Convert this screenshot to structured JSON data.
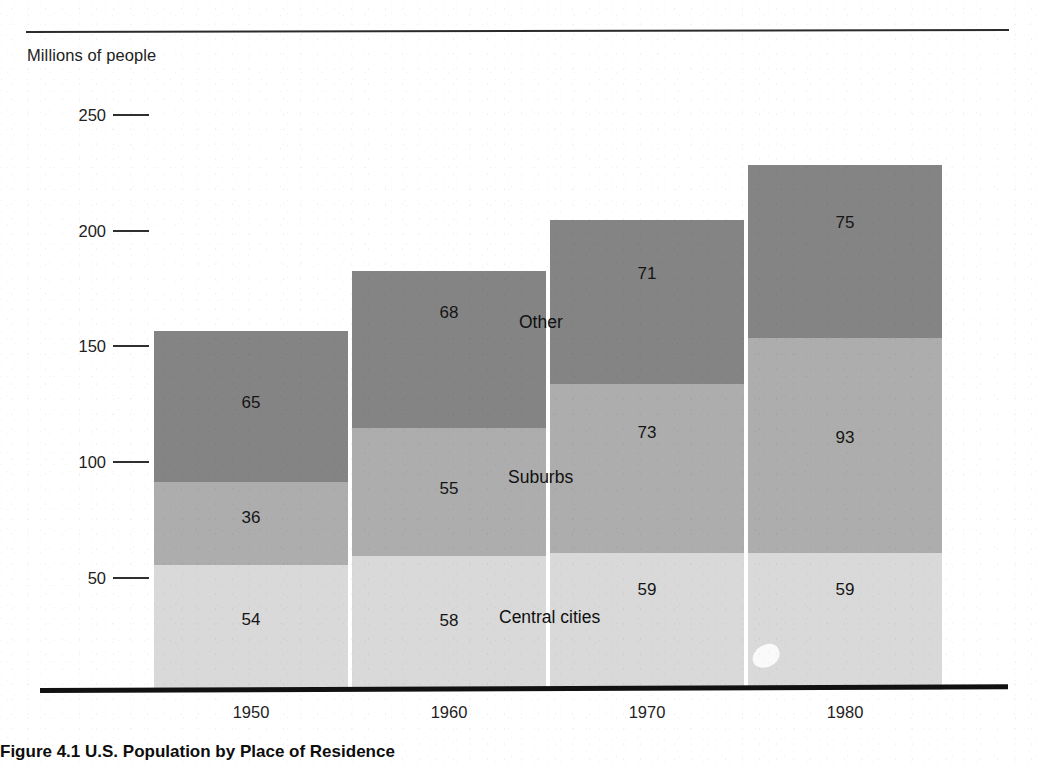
{
  "axis_title": "Millions of people",
  "caption": "Figure 4.1 U.S. Population by Place of Residence",
  "colors": {
    "other": "#848484",
    "suburbs": "#adadad",
    "central_cities": "#d9d9d9",
    "axis": "#111111",
    "text": "#1a1a1a"
  },
  "yticks": [
    {
      "label": "250"
    },
    {
      "label": "200"
    },
    {
      "label": "150"
    },
    {
      "label": "100"
    },
    {
      "label": "50"
    }
  ],
  "series_labels": {
    "other": "Other",
    "suburbs": "Suburbs",
    "central_cities": "Central cities"
  },
  "bars": [
    {
      "year": "1950",
      "central_cities": "54",
      "suburbs": "36",
      "other": "65"
    },
    {
      "year": "1960",
      "central_cities": "58",
      "suburbs": "55",
      "other": "68"
    },
    {
      "year": "1970",
      "central_cities": "59",
      "suburbs": "73",
      "other": "71"
    },
    {
      "year": "1980",
      "central_cities": "59",
      "suburbs": "93",
      "other": "75"
    }
  ],
  "chart_data": {
    "type": "bar",
    "subtype": "stacked-vertical",
    "title": "Figure 4.1 U.S. Population by Place of Residence",
    "xlabel": "",
    "ylabel": "Millions of people",
    "categories": [
      "1950",
      "1960",
      "1970",
      "1980"
    ],
    "series": [
      {
        "name": "Central cities",
        "values": [
          54,
          58,
          59,
          59
        ],
        "color": "#d9d9d9"
      },
      {
        "name": "Suburbs",
        "values": [
          36,
          55,
          73,
          93
        ],
        "color": "#adadad"
      },
      {
        "name": "Other",
        "values": [
          65,
          68,
          71,
          75
        ],
        "color": "#848484"
      }
    ],
    "totals": [
      155,
      181,
      203,
      227
    ],
    "ylim": [
      0,
      260
    ],
    "yticks": [
      50,
      100,
      150,
      200,
      250
    ],
    "grid": false,
    "legend": "inline-annotations",
    "data_labels": true
  }
}
